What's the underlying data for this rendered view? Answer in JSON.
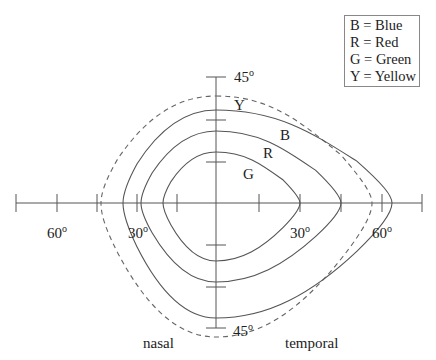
{
  "diagram": {
    "legend": {
      "items": [
        {
          "key": "B",
          "label": "B = Blue"
        },
        {
          "key": "R",
          "label": "R = Red"
        },
        {
          "key": "G",
          "label": "G = Green"
        },
        {
          "key": "Y",
          "label": "Y = Yellow"
        }
      ]
    },
    "axes": {
      "origin": [
        216,
        203
      ],
      "horizontal": {
        "x_start": 16,
        "x_end": 422,
        "ticks_x": [
          16,
          57,
          97,
          137,
          177,
          259,
          300,
          341,
          382,
          422
        ]
      },
      "vertical": {
        "y_start": 77,
        "y_end": 328,
        "ticks_y": [
          77,
          120,
          162,
          245,
          287,
          328
        ]
      }
    },
    "degree_labels": [
      {
        "text": "45",
        "sup": "o",
        "x": 234,
        "y": 82
      },
      {
        "text": "60",
        "sup": "o",
        "x": 47,
        "y": 238
      },
      {
        "text": "30",
        "sup": "o",
        "x": 128,
        "y": 238
      },
      {
        "text": "30",
        "sup": "o",
        "x": 290,
        "y": 238
      },
      {
        "text": "60",
        "sup": "o",
        "x": 372,
        "y": 238
      },
      {
        "text": "45",
        "sup": "o",
        "x": 233,
        "y": 336
      }
    ],
    "side_labels": {
      "left": "nasal",
      "right": "temporal"
    },
    "curve_labels": [
      {
        "key": "Y",
        "text": "Y",
        "x": 234,
        "y": 110
      },
      {
        "key": "B",
        "text": "B",
        "x": 280,
        "y": 140
      },
      {
        "key": "R",
        "text": "R",
        "x": 263,
        "y": 158
      },
      {
        "key": "G",
        "text": "G",
        "x": 243,
        "y": 179
      }
    ],
    "curves": [
      {
        "key": "Y",
        "color_name": "Yellow",
        "style": "dashed",
        "left": 101,
        "right": 372,
        "top": 96,
        "bottom": 337
      },
      {
        "key": "B",
        "color_name": "Blue",
        "style": "solid",
        "left": 123,
        "right": 392,
        "top": 110,
        "bottom": 318
      },
      {
        "key": "R",
        "color_name": "Red",
        "style": "solid",
        "left": 141,
        "right": 341,
        "top": 131,
        "bottom": 282
      },
      {
        "key": "G",
        "color_name": "Green",
        "style": "solid",
        "left": 163,
        "right": 300,
        "top": 152,
        "bottom": 261
      }
    ]
  }
}
